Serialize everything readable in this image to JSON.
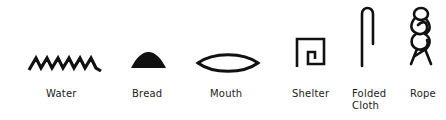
{
  "glyphs": [
    {
      "id": "water",
      "label": "Water",
      "icon": "zigzag-water-icon"
    },
    {
      "id": "bread",
      "label": "Bread",
      "icon": "bread-loaf-icon"
    },
    {
      "id": "mouth",
      "label": "Mouth",
      "icon": "mouth-oval-icon"
    },
    {
      "id": "shelter",
      "label": "Shelter",
      "icon": "shelter-square-icon"
    },
    {
      "id": "folded-cloth",
      "label_line1": "Folded",
      "label_line2": "Cloth",
      "icon": "folded-cloth-icon"
    },
    {
      "id": "rope",
      "label": "Rope",
      "icon": "twisted-rope-icon"
    }
  ],
  "colors": {
    "ink": "#111111",
    "text": "#222222",
    "background": "#ffffff"
  }
}
